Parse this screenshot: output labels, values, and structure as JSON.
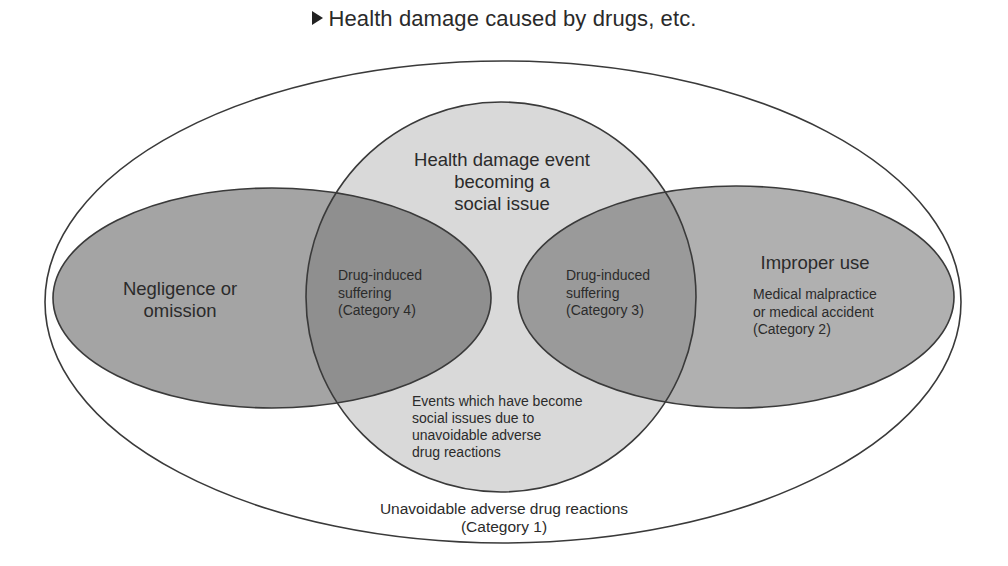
{
  "title": {
    "marker": "triangle-right-icon",
    "text": "Health damage caused by drugs, etc."
  },
  "regions": {
    "outer": {
      "label_line1": "Unavoidable adverse drug reactions",
      "label_line2": "(Category 1)",
      "fill": "#ffffff"
    },
    "center_circle": {
      "label_line1": "Health damage event",
      "label_line2": "becoming a",
      "label_line3": "social issue",
      "fill": "#d9d9d9"
    },
    "center_bottom": {
      "line1": "Events which have become",
      "line2": "social issues due to",
      "line3": "unavoidable adverse",
      "line4": "drug reactions"
    },
    "left_ellipse": {
      "label_line1": "Negligence or",
      "label_line2": "omission",
      "fill": "#a4a4a4"
    },
    "right_ellipse": {
      "label": "Improper use",
      "sub_line1": "Medical malpractice",
      "sub_line2": "or medical accident",
      "sub_line3": "(Category 2)",
      "fill": "#b0b0b0"
    },
    "left_overlap": {
      "line1": "Drug-induced",
      "line2": "suffering",
      "line3": "(Category 4)",
      "fill": "#8f8f8f"
    },
    "right_overlap": {
      "line1": "Drug-induced",
      "line2": "suffering",
      "line3": "(Category 3)",
      "fill": "#9a9a9a"
    }
  },
  "colors": {
    "stroke": "#3a3a3a",
    "text": "#2b2b2b",
    "background": "#ffffff"
  }
}
